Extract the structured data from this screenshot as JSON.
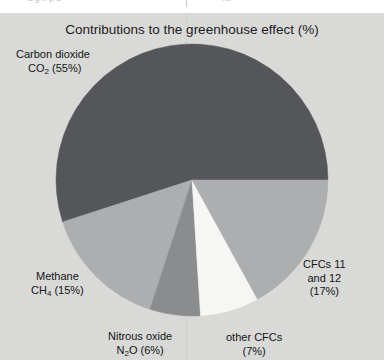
{
  "page": {
    "top_strip_text_left": "a  g   n            p   a",
    "top_strip_text_right": "nd",
    "background_color": "#d9dad7"
  },
  "chart_data": {
    "type": "pie",
    "title": "Contributions to the greenhouse effect (%)",
    "xlabel": "",
    "ylabel": "",
    "unit": "%",
    "legend_position": "outside-labels",
    "grid": false,
    "start_angle_deg": 0,
    "direction": "counterclockwise",
    "categories": [
      "Carbon dioxide CO2",
      "CFCs 11 and 12",
      "other CFCs",
      "Nitrous oxide N2O",
      "Methane CH4"
    ],
    "values": [
      55,
      17,
      7,
      6,
      15
    ],
    "colors": [
      "#55565a",
      "#adaeb0",
      "#f6f6f4",
      "#8b8c8e",
      "#adaeb0"
    ],
    "slices": [
      {
        "name": "carbon-dioxide",
        "value": 55,
        "color": "#55565a",
        "label_line1": "Carbon dioxide",
        "label_line2_pre": "CO",
        "label_line2_sub": "2",
        "label_line2_post": " (55%)"
      },
      {
        "name": "cfcs-11-and-12",
        "value": 17,
        "color": "#adaeb0",
        "label_line1": "CFCs 11",
        "label_line2": "and 12",
        "label_line3": "(17%)"
      },
      {
        "name": "other-cfcs",
        "value": 7,
        "color": "#f6f6f4",
        "label_line1": "other CFCs",
        "label_line2": "(7%)"
      },
      {
        "name": "nitrous-oxide",
        "value": 6,
        "color": "#8b8c8e",
        "label_line1": "Nitrous oxide",
        "label_line2_pre": "N",
        "label_line2_sub": "2",
        "label_line2_post": "O (6%)"
      },
      {
        "name": "methane",
        "value": 15,
        "color": "#adaeb0",
        "label_line1": "Methane",
        "label_line2_pre": "CH",
        "label_line2_sub": "4",
        "label_line2_post": " (15%)"
      }
    ]
  }
}
